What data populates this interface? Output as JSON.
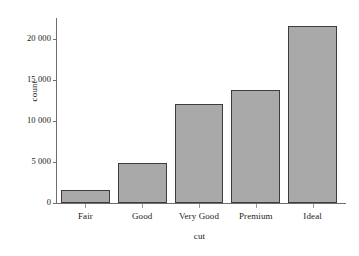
{
  "chart_data": {
    "type": "bar",
    "title": "",
    "xlabel": "cut",
    "ylabel": "count",
    "categories": [
      "Fair",
      "Good",
      "Very Good",
      "Premium",
      "Ideal"
    ],
    "values": [
      1610,
      4906,
      12082,
      13791,
      21551
    ],
    "ylim": [
      0,
      22500
    ],
    "yticks": [
      0,
      5000,
      10000,
      15000,
      20000
    ],
    "ytick_labels": [
      "0",
      "5 000",
      "10 000",
      "15 000",
      "20 000"
    ],
    "grid": false,
    "legend": null,
    "bar_fill_color": "#a9a9a9",
    "bar_border_color": "#3d3d3d",
    "axis_color": "#6e6e6e",
    "background_color": "#ffffff"
  }
}
